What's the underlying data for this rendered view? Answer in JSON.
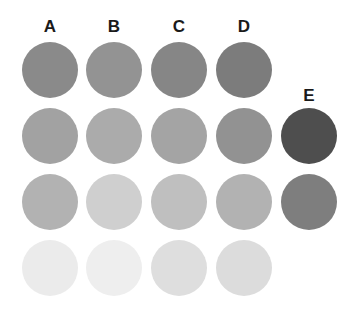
{
  "columns": [
    {
      "label": "A",
      "x": 50,
      "label_y": 18
    },
    {
      "label": "B",
      "x": 114,
      "label_y": 18
    },
    {
      "label": "C",
      "x": 179,
      "label_y": 18
    },
    {
      "label": "D",
      "x": 244,
      "label_y": 18
    },
    {
      "label": "E",
      "x": 309,
      "label_y": 87
    }
  ],
  "rows_y": [
    70,
    136,
    202,
    268
  ],
  "swatches": {
    "A": [
      "#8a8a8a",
      "#a2a2a2",
      "#b2b2b2",
      "#ebebeb"
    ],
    "B": [
      "#939393",
      "#ababab",
      "#cfcfcf",
      "#eeeeee"
    ],
    "C": [
      "#868686",
      "#a4a4a4",
      "#bfbfbf",
      "#dedede"
    ],
    "D": [
      "#7c7c7c",
      "#929292",
      "#b2b2b2",
      "#dcdcdc"
    ],
    "E": [
      null,
      "#4e4e4e",
      "#7e7e7e",
      null
    ]
  }
}
